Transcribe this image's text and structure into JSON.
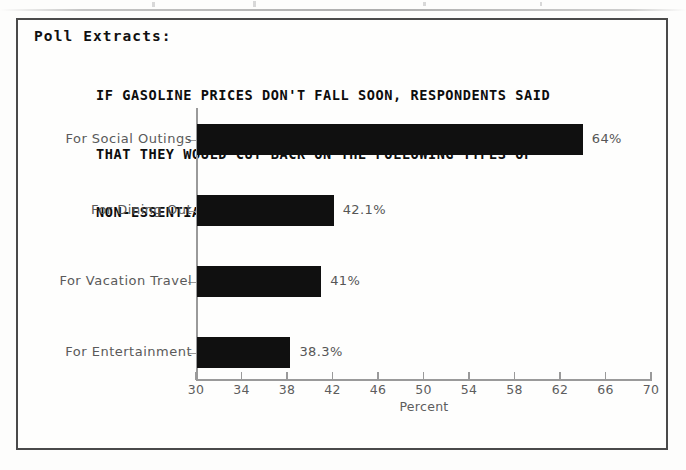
{
  "document": {
    "section_label": "Poll Extracts:",
    "title_lines": [
      "IF GASOLINE PRICES DON'T FALL SOON, RESPONDENTS SAID",
      "THAT THEY WOULD CUT BACK ON THE FOLLOWING TYPES OF",
      "NON-ESSENTIAL TRAVEL:"
    ]
  },
  "colors": {
    "bar": "#101010",
    "axis": "#9a9a9a",
    "frame": "#4a4a4a",
    "text": "#5a5a5a",
    "background": "#fefefd"
  },
  "chart_data": {
    "type": "bar",
    "orientation": "horizontal",
    "title": "IF GASOLINE PRICES DON'T FALL SOON, RESPONDENTS SAID THAT THEY WOULD CUT BACK ON THE FOLLOWING TYPES OF NON-ESSENTIAL TRAVEL:",
    "categories": [
      "For Social Outings",
      "For Dining Out",
      "For Vacation Travel",
      "For Entertainment"
    ],
    "values": [
      64,
      42.1,
      41,
      38.3
    ],
    "value_labels": [
      "64%",
      "42.1%",
      "41%",
      "38.3%"
    ],
    "xlabel": "Percent",
    "ylabel": "",
    "xlim": [
      30,
      70
    ],
    "xticks": [
      30,
      34,
      38,
      42,
      46,
      50,
      54,
      58,
      62,
      66,
      70
    ],
    "xtick_labels": [
      "30",
      "34",
      "38",
      "42",
      "46",
      "50",
      "54",
      "58",
      "62",
      "66",
      "70"
    ],
    "grid": false,
    "legend": null
  }
}
